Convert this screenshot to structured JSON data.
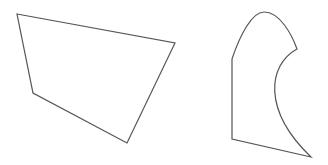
{
  "canvas": {
    "width": 328,
    "height": 165,
    "background": "#ffffff"
  },
  "stroke_color": "#555555",
  "shapes": [
    {
      "name": "quadrilateral",
      "type": "polygon",
      "points": [
        [
          17,
          14
        ],
        [
          175,
          43
        ],
        [
          127,
          143
        ],
        [
          33,
          93
        ]
      ]
    },
    {
      "name": "curved-shape",
      "type": "path",
      "d": "M232,139 L232,59 C240,35 252,12 264,12 C280,12 292,35 297,49 C268,65 262,110 311,157 Z"
    }
  ]
}
